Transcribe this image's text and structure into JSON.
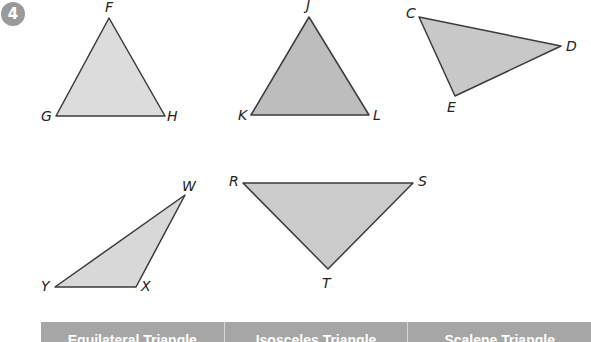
{
  "exercise": {
    "number": "4"
  },
  "triangles": [
    {
      "id": "FGH",
      "vertices": [
        {
          "label": "F",
          "x": 109,
          "y": 18,
          "lx": 105,
          "ly": 12
        },
        {
          "label": "G",
          "x": 56,
          "y": 116,
          "lx": 41,
          "ly": 121
        },
        {
          "label": "H",
          "x": 165,
          "y": 116,
          "lx": 167,
          "ly": 121
        }
      ],
      "fill": "#dcdcdc"
    },
    {
      "id": "JKL",
      "vertices": [
        {
          "label": "J",
          "x": 309,
          "y": 17,
          "lx": 306,
          "ly": 10
        },
        {
          "label": "K",
          "x": 251,
          "y": 115,
          "lx": 238,
          "ly": 120
        },
        {
          "label": "L",
          "x": 369,
          "y": 115,
          "lx": 373,
          "ly": 120
        }
      ],
      "fill": "#bdbdbd"
    },
    {
      "id": "CDE",
      "vertices": [
        {
          "label": "C",
          "x": 419,
          "y": 17,
          "lx": 406,
          "ly": 18
        },
        {
          "label": "D",
          "x": 561,
          "y": 46,
          "lx": 566,
          "ly": 51
        },
        {
          "label": "E",
          "x": 455,
          "y": 96,
          "lx": 447,
          "ly": 112
        }
      ],
      "fill": "#c8c8c8"
    },
    {
      "id": "WXY",
      "vertices": [
        {
          "label": "W",
          "x": 185,
          "y": 195,
          "lx": 182,
          "ly": 191
        },
        {
          "label": "X",
          "x": 136,
          "y": 287,
          "lx": 141,
          "ly": 291
        },
        {
          "label": "Y",
          "x": 55,
          "y": 287,
          "lx": 41,
          "ly": 291
        }
      ],
      "fill": "#d8d8d8"
    },
    {
      "id": "RST",
      "vertices": [
        {
          "label": "R",
          "x": 243,
          "y": 183,
          "lx": 229,
          "ly": 186
        },
        {
          "label": "S",
          "x": 413,
          "y": 183,
          "lx": 418,
          "ly": 186
        },
        {
          "label": "T",
          "x": 328,
          "y": 269,
          "lx": 322,
          "ly": 288
        }
      ],
      "fill": "#cbcbcb"
    }
  ],
  "table": {
    "headers": [
      "Equilateral Triangle",
      "Isosceles Triangle",
      "Scalene Triangle"
    ],
    "header_bg": "#a6a6a6"
  }
}
